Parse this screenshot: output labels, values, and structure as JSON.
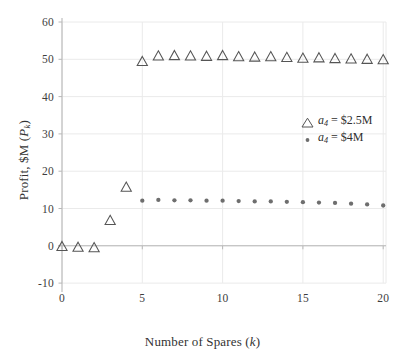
{
  "chart_data": {
    "type": "scatter",
    "title": "",
    "xlabel": "Number of Spares (k)",
    "ylabel": "Profit, $M (P_k)",
    "xlim": [
      -0.7,
      20.8
    ],
    "ylim": [
      -11.5,
      61.5
    ],
    "xticks": [
      0,
      5,
      10,
      15,
      20
    ],
    "yticks": [
      -10,
      0,
      10,
      20,
      30,
      40,
      50,
      60
    ],
    "xtick_labels": [
      "0",
      "5",
      "10",
      "15",
      "20"
    ],
    "ytick_labels": [
      "-10",
      "0",
      "10",
      "20",
      "30",
      "40",
      "50",
      "60"
    ],
    "grid": true,
    "legend_position": "center-right",
    "series": [
      {
        "name": "a_4 = $2.5M",
        "legend_label": "a₄ = $2.5M",
        "marker": "triangle-open",
        "color": "#555555",
        "x": [
          0,
          1,
          2,
          3,
          4,
          5,
          6,
          7,
          8,
          9,
          10,
          11,
          12,
          13,
          14,
          15,
          16,
          17,
          18,
          19,
          20
        ],
        "y": [
          -0.3,
          -0.5,
          -0.6,
          6.7,
          15.6,
          49.3,
          50.8,
          50.9,
          50.8,
          50.7,
          50.9,
          50.6,
          50.5,
          50.6,
          50.4,
          50.2,
          50.3,
          50.1,
          50.0,
          49.9,
          49.8
        ]
      },
      {
        "name": "a_4 = $4M",
        "legend_label": "a₄ = $4M",
        "marker": "circle-filled",
        "color": "#6e6e6e",
        "x": [
          5,
          6,
          7,
          8,
          9,
          10,
          11,
          12,
          13,
          14,
          15,
          16,
          17,
          18,
          19,
          20
        ],
        "y": [
          12.1,
          12.3,
          12.2,
          12.2,
          12.1,
          12.1,
          12.0,
          11.9,
          11.9,
          11.8,
          11.7,
          11.6,
          11.5,
          11.3,
          11.1,
          10.8
        ]
      }
    ]
  },
  "axes": {
    "xlabel": "Number of Spares (k)",
    "xlabel_base": "Number of Spares (",
    "xlabel_var": "k",
    "xlabel_close": ")",
    "ylabel_base": "Profit, $M (",
    "ylabel_var": "P",
    "ylabel_sub": "k",
    "ylabel_close": ")"
  },
  "legend": {
    "entries": [
      {
        "marker": "triangle-open-icon",
        "var": "a",
        "sub": "4",
        "eq": " = $2.5M"
      },
      {
        "marker": "dot-filled-icon",
        "var": "a",
        "sub": "4",
        "eq": " = $4M"
      }
    ]
  },
  "style": {
    "grid_color": "#eaeaea",
    "axis_color": "#b8b8b8",
    "marker_edge": "#555555",
    "dot_color": "#6e6e6e",
    "text_color": "#333333",
    "background": "#ffffff"
  }
}
